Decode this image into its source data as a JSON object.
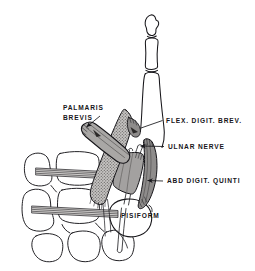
{
  "figure": {
    "background_color": "#ffffff",
    "ink_color": "#17161a",
    "muscle_fill_light": "#b9b7b5",
    "muscle_fill_mid": "#a3a1a0",
    "muscle_fill_dark": "#8e8c8b",
    "stipple_color": "#6d6b6a"
  },
  "labels": {
    "palmaris_brevis_line1": "PALMARIS",
    "palmaris_brevis_line2": "BREVIS",
    "flex_digit_brev": "FLEX. DIGIT. BREV.",
    "ulnar_nerve": "ULNAR NERVE",
    "abd_digit_quinti": "ABD  DIGIT. QUINTI",
    "pisiform": "PISIFORM"
  },
  "structures": [
    {
      "name": "little-finger-phalanges",
      "kind": "bone",
      "count": 3
    },
    {
      "name": "palmaris-brevis-muscle",
      "kind": "muscle"
    },
    {
      "name": "flexor-digiti-brevis-muscle",
      "kind": "muscle"
    },
    {
      "name": "abductor-digiti-quinti-muscle",
      "kind": "muscle"
    },
    {
      "name": "ulnar-nerve",
      "kind": "nerve"
    },
    {
      "name": "pisiform-bone",
      "kind": "bone"
    },
    {
      "name": "carpal-metacarpal-bones",
      "kind": "bone"
    },
    {
      "name": "flexor-tendon-bands",
      "kind": "tendon",
      "count": 2
    }
  ]
}
